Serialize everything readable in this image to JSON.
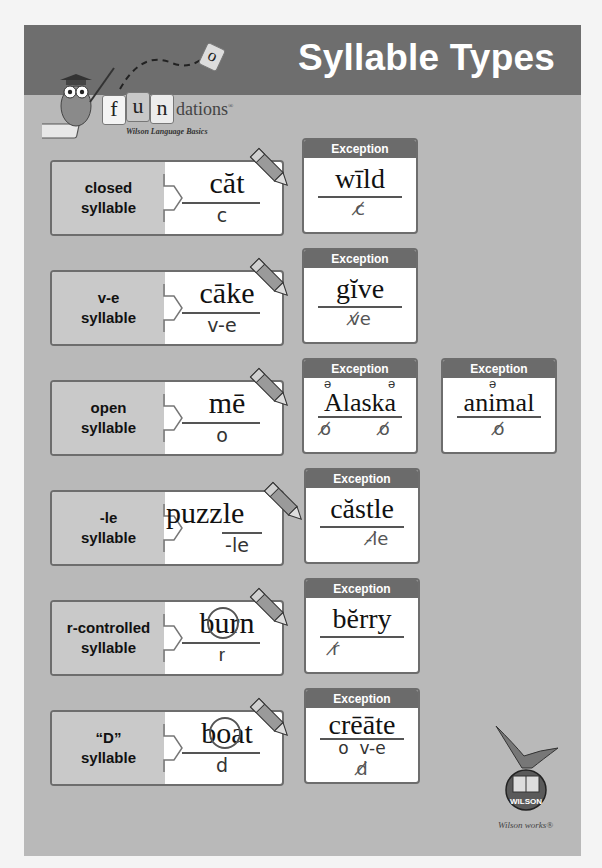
{
  "header": {
    "title": "Syllable Types",
    "logo": {
      "tiles": [
        "f",
        "u",
        "n"
      ],
      "flying_tile": "o",
      "word_rest": "dations",
      "registered": "®",
      "subtitle": "Wilson Language Basics",
      "mascot": "owl-teacher-icon"
    }
  },
  "colors": {
    "banner": "#6e6e6e",
    "poster_bg": "#b9b9b9",
    "label_bg": "#c9c9c9",
    "exception_header": "#6b6b6b",
    "title_text": "#ffffff"
  },
  "exception_label": "Exception",
  "rows": [
    {
      "label_line1": "closed",
      "label_line2": "syllable",
      "example": "căt",
      "code": "c",
      "marking": "underline",
      "exceptions": [
        {
          "word": "wīld",
          "mark": "c crossed out"
        }
      ]
    },
    {
      "label_line1": "v-e",
      "label_line2": "syllable",
      "example": "cāke",
      "code": "v-e",
      "marking": "e crossed out",
      "exceptions": [
        {
          "word": "gĭve",
          "mark": "v-e crossed out"
        }
      ]
    },
    {
      "label_line1": "open",
      "label_line2": "syllable",
      "example": "mē",
      "code": "o",
      "marking": "underline",
      "exceptions": [
        {
          "word": "Alaska",
          "schwa": "ə",
          "mark": "o crossed out (×2)"
        },
        {
          "word": "animal",
          "schwa": "ə",
          "mark": "o crossed out"
        }
      ]
    },
    {
      "label_line1": "-le",
      "label_line2": "syllable",
      "example": "puzzle",
      "code": "-le",
      "marking": "e crossed out",
      "exceptions": [
        {
          "word": "căstle",
          "mark": "-le crossed out"
        }
      ]
    },
    {
      "label_line1": "r-controlled",
      "label_line2": "syllable",
      "example": "burn",
      "code": "r",
      "marking": "ur circled",
      "exceptions": [
        {
          "word": "bĕrry",
          "mark": "r crossed out"
        }
      ]
    },
    {
      "label_line1": "“D”",
      "label_line2": "syllable",
      "example": "boat",
      "code": "d",
      "marking": "oa circled",
      "exceptions": [
        {
          "word": "crēāte",
          "codes": "o  v-e",
          "mark": "d crossed out"
        }
      ]
    }
  ],
  "footer": {
    "logo_text": "WILSON",
    "tagline": "Wilson works®"
  }
}
